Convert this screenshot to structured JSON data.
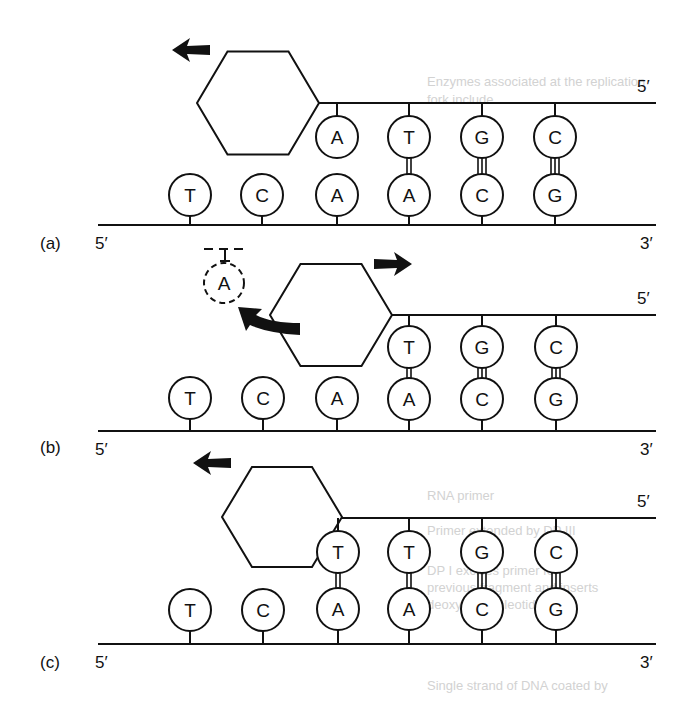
{
  "figure": {
    "stroke_color": "#111111",
    "background": "#ffffff",
    "ghost_color": "#d2d2d2"
  },
  "ghost_text": [
    {
      "text": "Enzymes associated at the replication",
      "x": 427,
      "y": 86
    },
    {
      "text": "fork include",
      "x": 427,
      "y": 104
    },
    {
      "text": "RNA primer",
      "x": 427,
      "y": 500
    },
    {
      "text": "Primer extended by DP III",
      "x": 427,
      "y": 535
    },
    {
      "text": "DP I excises primer for",
      "x": 427,
      "y": 575
    },
    {
      "text": "previous fragment and inserts",
      "x": 427,
      "y": 592
    },
    {
      "text": "deoxyribonucleotides",
      "x": 427,
      "y": 609
    },
    {
      "text": "Single strand of DNA coated by",
      "x": 427,
      "y": 690
    }
  ],
  "panels": [
    {
      "label": "(a)",
      "label_pos": [
        40,
        244
      ],
      "bottom_strand": {
        "y": 225,
        "x1": 98,
        "x2": 656,
        "left_label": "5′",
        "right_label": "3′"
      },
      "top_strand": {
        "y": 103,
        "x1": 318,
        "x2": 656,
        "right_label": "5′"
      },
      "polymerase": {
        "cx": 258,
        "cy": 103,
        "w": 122,
        "h": 103
      },
      "arrows": [
        {
          "type": "straight",
          "dir": "left",
          "x": 172,
          "y": 50
        }
      ],
      "bottom_bases": [
        {
          "base": "T",
          "x": 190,
          "y": 195
        },
        {
          "base": "C",
          "x": 262,
          "y": 195
        },
        {
          "base": "A",
          "x": 337,
          "y": 195
        },
        {
          "base": "A",
          "x": 409,
          "y": 195
        },
        {
          "base": "C",
          "x": 482,
          "y": 195
        },
        {
          "base": "G",
          "x": 555,
          "y": 195
        }
      ],
      "top_bases": [
        {
          "base": "A",
          "x": 337,
          "y": 137,
          "bonds": 0
        },
        {
          "base": "T",
          "x": 409,
          "y": 137,
          "bonds": 2
        },
        {
          "base": "G",
          "x": 482,
          "y": 137,
          "bonds": 3
        },
        {
          "base": "C",
          "x": 555,
          "y": 137,
          "bonds": 3
        }
      ],
      "removed_base": null
    },
    {
      "label": "(b)",
      "label_pos": [
        40,
        448
      ],
      "bottom_strand": {
        "y": 431,
        "x1": 98,
        "x2": 656,
        "left_label": "5′",
        "right_label": "3′"
      },
      "top_strand": {
        "y": 315,
        "x1": 392,
        "x2": 656,
        "right_label": "5′"
      },
      "polymerase": {
        "cx": 331,
        "cy": 315,
        "w": 122,
        "h": 102
      },
      "arrows": [
        {
          "type": "straight",
          "dir": "right",
          "x": 412,
          "y": 264
        },
        {
          "type": "curved",
          "dir": "up-left",
          "x": 238,
          "y": 307
        }
      ],
      "bottom_bases": [
        {
          "base": "T",
          "x": 190,
          "y": 398
        },
        {
          "base": "C",
          "x": 263,
          "y": 398
        },
        {
          "base": "A",
          "x": 337,
          "y": 398
        },
        {
          "base": "A",
          "x": 409,
          "y": 399
        },
        {
          "base": "C",
          "x": 482,
          "y": 399
        },
        {
          "base": "G",
          "x": 556,
          "y": 399
        }
      ],
      "top_bases": [
        {
          "base": "T",
          "x": 409,
          "y": 347,
          "bonds": 2
        },
        {
          "base": "G",
          "x": 482,
          "y": 347,
          "bonds": 3
        },
        {
          "base": "C",
          "x": 556,
          "y": 347,
          "bonds": 3
        }
      ],
      "removed_base": {
        "base": "A",
        "x": 224,
        "y": 283,
        "dashed_line_y": 249,
        "dashed_x1": 204,
        "dashed_x2": 246
      }
    },
    {
      "label": "(c)",
      "label_pos": [
        40,
        663
      ],
      "bottom_strand": {
        "y": 644,
        "x1": 98,
        "x2": 656,
        "left_label": "5′",
        "right_label": "3′"
      },
      "top_strand": {
        "y": 518,
        "x1": 312,
        "x2": 656,
        "right_label": "5′"
      },
      "polymerase": {
        "cx": 282,
        "cy": 517,
        "w": 120,
        "h": 100
      },
      "arrows": [
        {
          "type": "straight",
          "dir": "left",
          "x": 193,
          "y": 463
        }
      ],
      "bottom_bases": [
        {
          "base": "T",
          "x": 190,
          "y": 610
        },
        {
          "base": "C",
          "x": 263,
          "y": 610
        },
        {
          "base": "A",
          "x": 338,
          "y": 609
        },
        {
          "base": "A",
          "x": 409,
          "y": 609
        },
        {
          "base": "C",
          "x": 482,
          "y": 609
        },
        {
          "base": "G",
          "x": 556,
          "y": 609
        }
      ],
      "top_bases": [
        {
          "base": "T",
          "x": 338,
          "y": 552,
          "bonds": 2
        },
        {
          "base": "T",
          "x": 409,
          "y": 552,
          "bonds": 2
        },
        {
          "base": "G",
          "x": 482,
          "y": 552,
          "bonds": 3
        },
        {
          "base": "C",
          "x": 556,
          "y": 552,
          "bonds": 3
        }
      ],
      "removed_base": null
    }
  ]
}
